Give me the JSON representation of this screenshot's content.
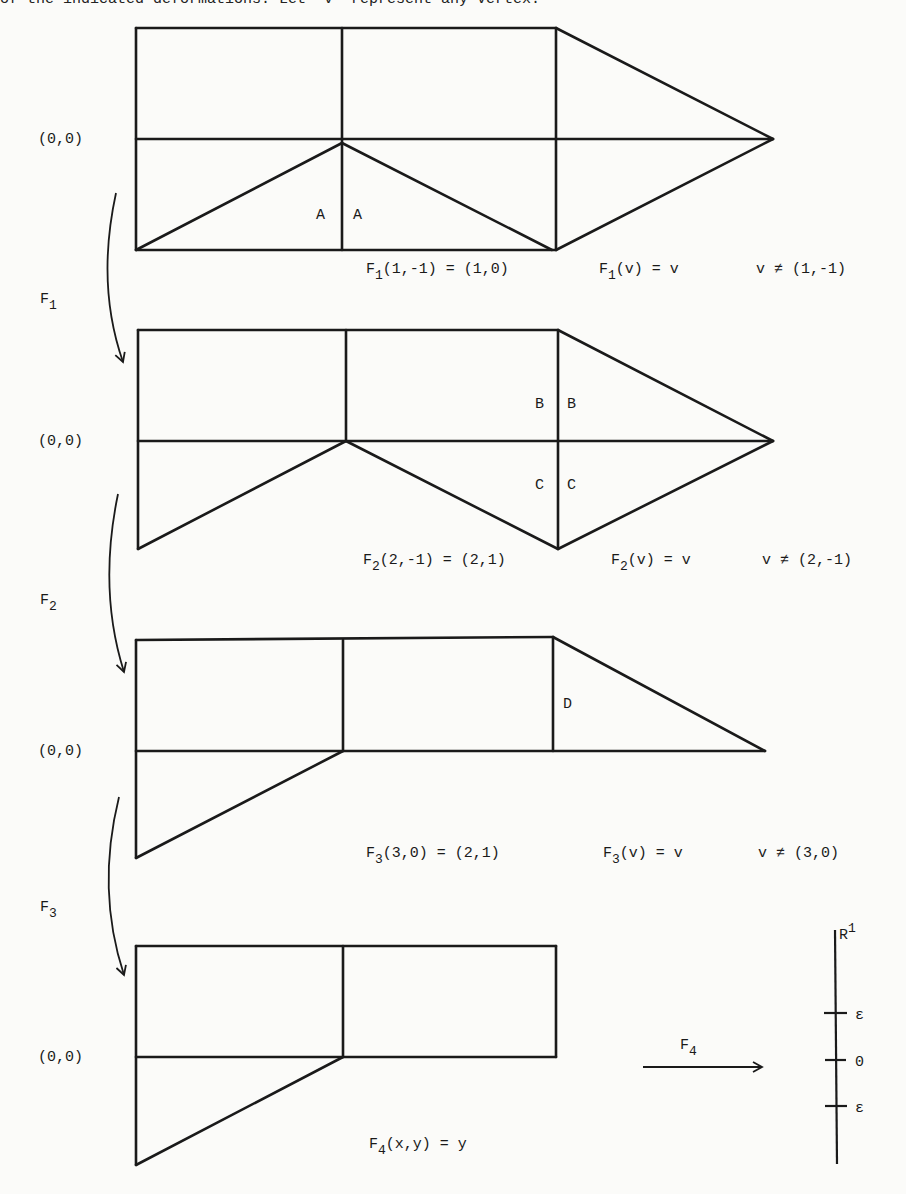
{
  "header_fragment": "of the indicated deformations. Let \"v\" represent any vertex.",
  "origin_label": "(0,0)",
  "stages": [
    {
      "id": "stage-1",
      "region_labels": [
        "A",
        "A"
      ],
      "map_name": "F",
      "map_sub": "1",
      "eq1": {
        "f": "F",
        "sub": "1",
        "text": "(1,-1) = (1,0)"
      },
      "eq2": {
        "f": "F",
        "sub": "1",
        "text": "(v) = v"
      },
      "eq3": "v ≠ (1,-1)"
    },
    {
      "id": "stage-2",
      "region_labels": [
        "B",
        "B",
        "C",
        "C"
      ],
      "map_name": "F",
      "map_sub": "2",
      "eq1": {
        "f": "F",
        "sub": "2",
        "text": "(2,-1) = (2,1)"
      },
      "eq2": {
        "f": "F",
        "sub": "2",
        "text": "(v) = v"
      },
      "eq3": "v ≠ (2,-1)"
    },
    {
      "id": "stage-3",
      "region_labels": [
        "D"
      ],
      "map_name": "F",
      "map_sub": "3",
      "eq1": {
        "f": "F",
        "sub": "3",
        "text": "(3,0) = (2,1)"
      },
      "eq2": {
        "f": "F",
        "sub": "3",
        "text": "(v) = v"
      },
      "eq3": "v ≠ (3,0)"
    },
    {
      "id": "stage-4",
      "eq1": {
        "f": "F",
        "sub": "4",
        "text": "(x,y) = y"
      }
    }
  ],
  "final_map": {
    "name": "F",
    "sub": "4"
  },
  "number_line": {
    "space": "R",
    "space_sup": "1",
    "ticks": [
      "ε",
      "0",
      "ε"
    ]
  }
}
